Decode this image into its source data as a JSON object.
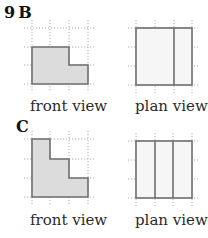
{
  "question_number": "9",
  "parts": [
    {
      "letter": "B",
      "front_view": {
        "label": "front view",
        "outline_points": [
          [
            32,
            47
          ],
          [
            69,
            47
          ],
          [
            69,
            65
          ],
          [
            88,
            65
          ],
          [
            88,
            84
          ],
          [
            32,
            84
          ]
        ],
        "grid": {
          "x": [
            32,
            50,
            69,
            88
          ],
          "y": [
            28,
            47,
            65,
            84
          ]
        }
      },
      "plan_view": {
        "label": "plan view",
        "rect": [
          136,
          28,
          192,
          85
        ],
        "dividers_x": [
          174
        ],
        "grid": {
          "x": [
            136,
            155,
            174,
            192
          ],
          "y": [
            28,
            47,
            66,
            85
          ]
        }
      }
    },
    {
      "letter": "C",
      "front_view": {
        "label": "front view",
        "outline_points": [
          [
            32,
            139
          ],
          [
            50,
            139
          ],
          [
            50,
            159
          ],
          [
            69,
            159
          ],
          [
            69,
            178
          ],
          [
            88,
            178
          ],
          [
            88,
            197
          ],
          [
            32,
            197
          ]
        ],
        "grid": {
          "x": [
            32,
            50,
            69,
            88
          ],
          "y": [
            139,
            159,
            178,
            197
          ]
        }
      },
      "plan_view": {
        "label": "plan view",
        "rect": [
          136,
          141,
          192,
          198
        ],
        "dividers_x": [
          155,
          173
        ],
        "grid": {
          "x": [
            136,
            155,
            173,
            192
          ],
          "y": [
            141,
            160,
            179,
            198
          ]
        }
      }
    }
  ],
  "colors": {
    "front_fill": "#dcdcdc",
    "plan_fill": "#f6f6f6",
    "outline": "#6e6e6e",
    "grid": "#9a9a9a"
  }
}
